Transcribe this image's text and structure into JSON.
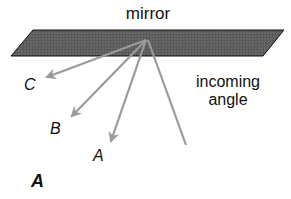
{
  "diagram": {
    "title_label": "mirror",
    "incoming_label_line1": "incoming",
    "incoming_label_line2": "angle",
    "ray_labels": {
      "c": "C",
      "b": "B",
      "a": "A"
    },
    "panel_label": "A",
    "colors": {
      "mirror_fill": "#5e5e5e",
      "mirror_stroke": "#111111",
      "ray": "#9a9a9a",
      "text": "#111111"
    }
  }
}
